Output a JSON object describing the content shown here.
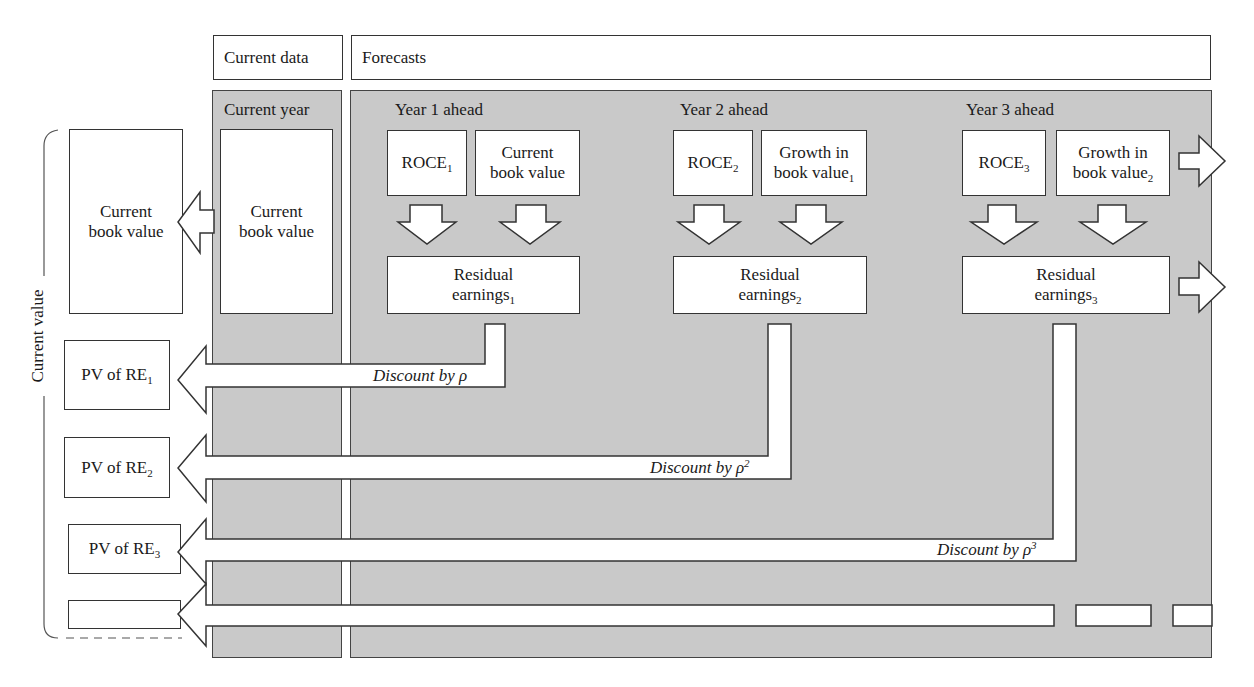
{
  "header": {
    "current_data": "Current data",
    "forecasts": "Forecasts"
  },
  "current_year": {
    "title": "Current year",
    "box": "Current book value"
  },
  "years": [
    {
      "title": "Year 1 ahead",
      "roce": "ROCE",
      "roce_sub": "1",
      "bv_line1": "Current",
      "bv_line2": "book value",
      "bv_sub": "",
      "re_line1": "Residual",
      "re_line2": "earnings",
      "re_sub": "1",
      "discount": "Discount by ρ",
      "discount_sup": ""
    },
    {
      "title": "Year 2 ahead",
      "roce": "ROCE",
      "roce_sub": "2",
      "bv_line1": "Growth in",
      "bv_line2": "book value",
      "bv_sub": "1",
      "re_line1": "Residual",
      "re_line2": "earnings",
      "re_sub": "2",
      "discount": "Discount by ρ",
      "discount_sup": "2"
    },
    {
      "title": "Year 3 ahead",
      "roce": "ROCE",
      "roce_sub": "3",
      "bv_line1": "Growth in",
      "bv_line2": "book value",
      "bv_sub": "2",
      "re_line1": "Residual",
      "re_line2": "earnings",
      "re_sub": "3",
      "discount": "Discount by ρ",
      "discount_sup": "3"
    }
  ],
  "left": {
    "current_value_label": "Current value",
    "cbv_line1": "Current",
    "cbv_line2": "book value",
    "pv": [
      {
        "text": "PV of RE",
        "sub": "1"
      },
      {
        "text": "PV of RE",
        "sub": "2"
      },
      {
        "text": "PV of RE",
        "sub": "3"
      }
    ]
  },
  "colors": {
    "panel": "#c9c9c9",
    "stroke": "#333333",
    "box": "#ffffff"
  }
}
